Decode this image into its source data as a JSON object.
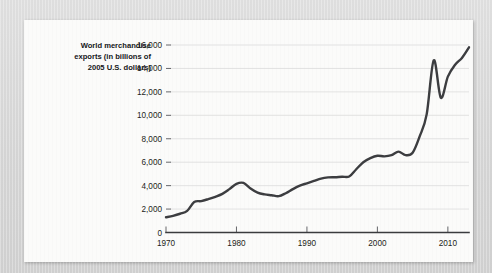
{
  "figure": {
    "background_color": "#d9d9d9",
    "panel_color": "#fbfbfa",
    "line_color": "#3c3d40",
    "grid_color": "#dcdcdc"
  },
  "axis_title": {
    "line1": "World merchandise",
    "line2": "exports (in billions of",
    "line3": "2005 U.S. dollars)"
  },
  "chart_data": {
    "type": "line",
    "title": "",
    "xlabel": "",
    "ylabel": "World merchandise exports (in billions of 2005 U.S. dollars)",
    "xlim": [
      1970,
      2013
    ],
    "ylim": [
      0,
      16000
    ],
    "grid": true,
    "legend": "none",
    "ytick_labels": [
      "0",
      "2,000",
      "4,000",
      "6,000",
      "8,000",
      "10,000",
      "12,000",
      "14,000",
      "16,000"
    ],
    "ytick_values": [
      0,
      2000,
      4000,
      6000,
      8000,
      10000,
      12000,
      14000,
      16000
    ],
    "xtick_labels": [
      "1970",
      "1980",
      "1990",
      "2000",
      "2010"
    ],
    "xtick_values": [
      1970,
      1980,
      1990,
      2000,
      2010
    ],
    "x": [
      1970,
      1971,
      1972,
      1973,
      1974,
      1975,
      1976,
      1977,
      1978,
      1979,
      1980,
      1981,
      1982,
      1983,
      1984,
      1985,
      1986,
      1987,
      1988,
      1989,
      1990,
      1991,
      1992,
      1993,
      1994,
      1995,
      1996,
      1997,
      1998,
      1999,
      2000,
      2001,
      2002,
      2003,
      2004,
      2005,
      2006,
      2007,
      2008,
      2009,
      2010,
      2011,
      2012,
      2013
    ],
    "values": [
      1300,
      1420,
      1600,
      1850,
      2600,
      2680,
      2850,
      3050,
      3300,
      3700,
      4150,
      4230,
      3750,
      3400,
      3250,
      3180,
      3100,
      3350,
      3700,
      4000,
      4200,
      4400,
      4600,
      4700,
      4720,
      4760,
      4780,
      5400,
      6000,
      6350,
      6550,
      6500,
      6600,
      6900,
      6600,
      6800,
      8200,
      10100,
      14700,
      11500,
      13300,
      14300,
      14900,
      15800
    ],
    "series_name": "World merchandise exports",
    "annotations": [
      {
        "label": "1980 peak",
        "x": 1981,
        "y": 4230
      },
      {
        "label": "mid-1980s trough",
        "x": 1986,
        "y": 3100
      },
      {
        "label": "2008 peak",
        "x": 2008,
        "y": 14700
      },
      {
        "label": "2009 crisis trough",
        "x": 2009,
        "y": 11500
      },
      {
        "label": "2013 end",
        "x": 2013,
        "y": 15800
      }
    ]
  }
}
